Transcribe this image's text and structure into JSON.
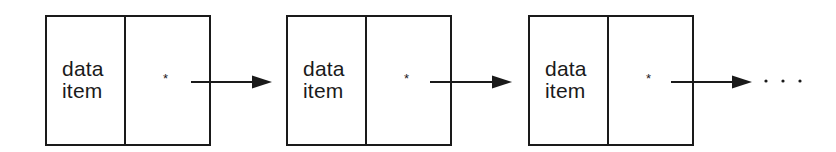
{
  "diagram": {
    "type": "linked-list",
    "colors": {
      "stroke": "#1a1a1a",
      "background": "#ffffff"
    },
    "nodes": [
      {
        "data_line1": "data",
        "data_line2": "item",
        "pointer": "*"
      },
      {
        "data_line1": "data",
        "data_line2": "item",
        "pointer": "*"
      },
      {
        "data_line1": "data",
        "data_line2": "item",
        "pointer": "*"
      }
    ],
    "continuation": "· · ·"
  }
}
